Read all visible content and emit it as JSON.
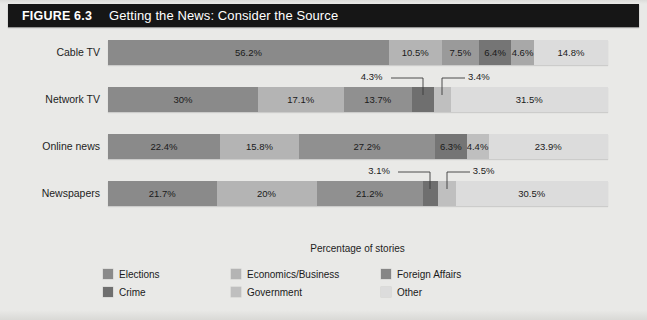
{
  "figure": {
    "number_label": "FIGURE 6.3",
    "title": "Getting the News: Consider the Source"
  },
  "chart_data": {
    "type": "bar",
    "orientation": "horizontal",
    "stacked": true,
    "normalized_percent": true,
    "title": "Getting the News: Consider the Source",
    "xlabel": "Percentage of stories",
    "ylabel": "",
    "xlim": [
      0,
      100
    ],
    "grid": false,
    "legend_position": "bottom",
    "categories": [
      "Cable TV",
      "Network TV",
      "Online news",
      "Newspapers"
    ],
    "series": [
      {
        "name": "Elections",
        "color": "#8a8a8a",
        "values": [
          56.2,
          30.0,
          22.4,
          21.7
        ]
      },
      {
        "name": "Economics/Business",
        "color": "#b4b4b4",
        "values": [
          10.5,
          17.1,
          15.8,
          20.0
        ]
      },
      {
        "name": "Foreign Affairs",
        "color": "#8a8a8a",
        "values": [
          7.5,
          13.7,
          27.2,
          21.2
        ]
      },
      {
        "name": "Crime",
        "color": "#6f6f6f",
        "values": [
          6.4,
          4.3,
          6.3,
          3.1
        ]
      },
      {
        "name": "Government",
        "color": "#bfbfbf",
        "values": [
          4.6,
          3.4,
          4.4,
          3.5
        ]
      },
      {
        "name": "Other",
        "color": "#dcdcdc",
        "values": [
          14.8,
          31.5,
          23.9,
          30.5
        ]
      }
    ],
    "rows": [
      {
        "label": "Cable TV",
        "segments": [
          {
            "series": "Elections",
            "value": 56.2,
            "label": "56.2%",
            "color": "#8a8a8a",
            "label_inside": true
          },
          {
            "series": "Economics/Business",
            "value": 10.5,
            "label": "10.5%",
            "color": "#b4b4b4",
            "label_inside": true
          },
          {
            "series": "Foreign Affairs",
            "value": 7.5,
            "label": "7.5%",
            "color": "#9a9a9a",
            "label_inside": true
          },
          {
            "series": "Crime",
            "value": 6.4,
            "label": "6.4%",
            "color": "#757575",
            "label_inside": true
          },
          {
            "series": "Government",
            "value": 4.6,
            "label": "4.6%",
            "color": "#a8a8a8",
            "label_inside": true
          },
          {
            "series": "Other",
            "value": 14.8,
            "label": "14.8%",
            "color": "#dcdcdc",
            "label_inside": true
          }
        ],
        "callouts": []
      },
      {
        "label": "Network TV",
        "segments": [
          {
            "series": "Elections",
            "value": 30.0,
            "label": "30%",
            "color": "#8a8a8a",
            "label_inside": true
          },
          {
            "series": "Economics/Business",
            "value": 17.1,
            "label": "17.1%",
            "color": "#b4b4b4",
            "label_inside": true
          },
          {
            "series": "Foreign Affairs",
            "value": 13.7,
            "label": "13.7%",
            "color": "#909090",
            "label_inside": true
          },
          {
            "series": "Crime",
            "value": 4.3,
            "label": "4.3%",
            "color": "#6f6f6f",
            "label_inside": false
          },
          {
            "series": "Government",
            "value": 3.4,
            "label": "3.4%",
            "color": "#bfbfbf",
            "label_inside": false
          },
          {
            "series": "Other",
            "value": 31.5,
            "label": "31.5%",
            "color": "#dcdcdc",
            "label_inside": true
          }
        ],
        "callouts": [
          {
            "label": "4.3%",
            "side": "left"
          },
          {
            "label": "3.4%",
            "side": "right"
          }
        ]
      },
      {
        "label": "Online news",
        "segments": [
          {
            "series": "Elections",
            "value": 22.4,
            "label": "22.4%",
            "color": "#8a8a8a",
            "label_inside": true
          },
          {
            "series": "Economics/Business",
            "value": 15.8,
            "label": "15.8%",
            "color": "#b4b4b4",
            "label_inside": true
          },
          {
            "series": "Foreign Affairs",
            "value": 27.2,
            "label": "27.2%",
            "color": "#909090",
            "label_inside": true
          },
          {
            "series": "Crime",
            "value": 6.3,
            "label": "6.3%",
            "color": "#757575",
            "label_inside": true
          },
          {
            "series": "Government",
            "value": 4.4,
            "label": "4.4%",
            "color": "#bfbfbf",
            "label_inside": true
          },
          {
            "series": "Other",
            "value": 23.9,
            "label": "23.9%",
            "color": "#dcdcdc",
            "label_inside": true
          }
        ],
        "callouts": []
      },
      {
        "label": "Newspapers",
        "segments": [
          {
            "series": "Elections",
            "value": 21.7,
            "label": "21.7%",
            "color": "#8a8a8a",
            "label_inside": true
          },
          {
            "series": "Economics/Business",
            "value": 20.0,
            "label": "20%",
            "color": "#b4b4b4",
            "label_inside": true
          },
          {
            "series": "Foreign Affairs",
            "value": 21.2,
            "label": "21.2%",
            "color": "#909090",
            "label_inside": true
          },
          {
            "series": "Crime",
            "value": 3.1,
            "label": "3.1%",
            "color": "#6f6f6f",
            "label_inside": false
          },
          {
            "series": "Government",
            "value": 3.5,
            "label": "3.5%",
            "color": "#bfbfbf",
            "label_inside": false
          },
          {
            "series": "Other",
            "value": 30.5,
            "label": "30.5%",
            "color": "#dcdcdc",
            "label_inside": true
          }
        ],
        "callouts": [
          {
            "label": "3.1%",
            "side": "left"
          },
          {
            "label": "3.5%",
            "side": "right"
          }
        ]
      }
    ]
  },
  "axis": {
    "x_title": "Percentage of stories"
  },
  "legend": {
    "items": [
      {
        "label": "Elections",
        "color": "#8a8a8a"
      },
      {
        "label": "Economics/Business",
        "color": "#b4b4b4"
      },
      {
        "label": "Foreign Affairs",
        "color": "#868686"
      },
      {
        "label": "Crime",
        "color": "#6f6f6f"
      },
      {
        "label": "Government",
        "color": "#bfbfbf"
      },
      {
        "label": "Other",
        "color": "#dcdcdc"
      }
    ]
  }
}
